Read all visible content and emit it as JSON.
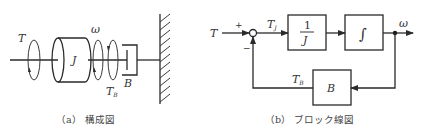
{
  "figure_a": {
    "caption": "（a） 構成図",
    "labels": {
      "torque": "T",
      "inertia": "J",
      "omega": "ω",
      "damper_torque": "T",
      "damper_torque_sub": "B",
      "damper": "B"
    }
  },
  "figure_b": {
    "caption": "（b） ブロック線図",
    "labels": {
      "input": "T",
      "plus": "+",
      "minus": "−",
      "tj": "T",
      "tj_sub": "J",
      "block1_num": "1",
      "block1_den": "J",
      "block2": "∫",
      "output": "ω",
      "tb": "T",
      "tb_sub": "B",
      "feedback_block": "B"
    }
  }
}
